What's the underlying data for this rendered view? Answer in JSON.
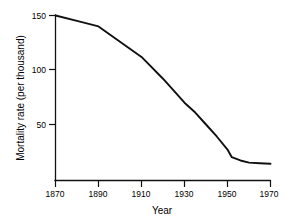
{
  "chart_data": {
    "type": "line",
    "title": "",
    "xlabel": "Year",
    "ylabel": "Mortality rate (per thousand)",
    "xlim": [
      1870,
      1970
    ],
    "ylim": [
      0,
      150
    ],
    "xticks": [
      1870,
      1890,
      1910,
      1930,
      1950,
      1970
    ],
    "xtick_labels": [
      "1870",
      "1890",
      "1910",
      "1930",
      "1950",
      "1970"
    ],
    "yticks": [
      50,
      100,
      150
    ],
    "ytick_labels": [
      "50",
      "100",
      "150"
    ],
    "grid": false,
    "legend": null,
    "line_color": "#111111",
    "series": [
      {
        "name": "Mortality rate",
        "x": [
          1870,
          1880,
          1890,
          1900,
          1910,
          1920,
          1930,
          1935,
          1940,
          1945,
          1950,
          1952,
          1956,
          1960,
          1965,
          1970
        ],
        "values": [
          150,
          145,
          140,
          126,
          112,
          92,
          70,
          61,
          50,
          39,
          27,
          20,
          17,
          15,
          14.5,
          14
        ]
      }
    ]
  },
  "axis": {
    "xlabel": "Year",
    "ylabel": "Mortality rate (per thousand)",
    "xtick_1": "1870",
    "xtick_2": "1890",
    "xtick_3": "1910",
    "xtick_4": "1930",
    "xtick_5": "1950",
    "xtick_6": "1970",
    "ytick_1": "50",
    "ytick_2": "100",
    "ytick_3": "150"
  }
}
